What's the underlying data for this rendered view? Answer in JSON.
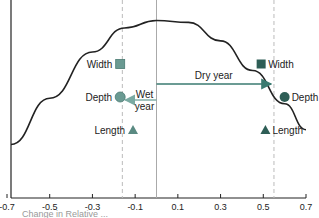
{
  "chart_data": {
    "type": "scatter",
    "title": "",
    "xlabel": "",
    "ylabel": "",
    "xlim": [
      -0.7,
      0.7
    ],
    "x_ticks": [
      -0.7,
      -0.5,
      -0.3,
      -0.1,
      0.1,
      0.3,
      0.5,
      0.7
    ],
    "x_tick_labels": [
      "-0.7",
      "-0.5",
      "-0.3",
      "-0.1",
      "0.1",
      "0.3",
      "0.5",
      "0.7"
    ],
    "grid": false,
    "reference_lines": [
      {
        "name": "wet-year-line",
        "x": -0.16,
        "style": "dashed"
      },
      {
        "name": "zero-line",
        "x": 0.0,
        "style": "solid"
      },
      {
        "name": "dry-year-line",
        "x": 0.55,
        "style": "dashed"
      }
    ],
    "curve": {
      "name": "response-curve",
      "description": "smooth hump peaking near x=0",
      "points": [
        [
          -0.7,
          0.3
        ],
        [
          -0.5,
          0.55
        ],
        [
          -0.3,
          0.8
        ],
        [
          -0.15,
          0.93
        ],
        [
          0.0,
          0.97
        ],
        [
          0.15,
          0.96
        ],
        [
          0.3,
          0.86
        ],
        [
          0.45,
          0.7
        ],
        [
          0.6,
          0.52
        ],
        [
          0.7,
          0.38
        ]
      ]
    },
    "series": [
      {
        "name": "Wet year",
        "color": "#6a9a92",
        "points": [
          {
            "label": "Width",
            "marker": "square",
            "x": -0.17,
            "row": 1
          },
          {
            "label": "Depth",
            "marker": "circle",
            "x": -0.17,
            "row": 2
          },
          {
            "label": "Length",
            "marker": "triangle",
            "x": -0.11,
            "row": 3
          }
        ]
      },
      {
        "name": "Dry year",
        "color": "#2e5e56",
        "points": [
          {
            "label": "Width",
            "marker": "square",
            "x": 0.49,
            "row": 1
          },
          {
            "label": "Depth",
            "marker": "circle",
            "x": 0.6,
            "row": 2
          },
          {
            "label": "Length",
            "marker": "triangle",
            "x": 0.51,
            "row": 3
          }
        ]
      }
    ],
    "annotations": [
      {
        "name": "dry-year-arrow",
        "text": "Dry year",
        "from_x": 0.0,
        "to_x": 0.55,
        "direction": "right",
        "color": "#3a7a70"
      },
      {
        "name": "wet-year-arrow",
        "text_lines": [
          "Wet",
          "year"
        ],
        "from_x": 0.0,
        "to_x": -0.16,
        "direction": "left",
        "color": "#7aaaa2"
      }
    ],
    "caption_partial": "Change in Relative ..."
  }
}
